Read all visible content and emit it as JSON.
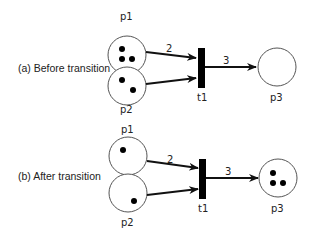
{
  "panels": [
    {
      "caption": "(a) Before transition",
      "places": {
        "p1": {
          "label": "p1",
          "tokens": 3
        },
        "p2": {
          "label": "p2",
          "tokens": 2
        },
        "p3": {
          "label": "p3",
          "tokens": 0
        }
      },
      "transition": {
        "label": "t1"
      },
      "arcs": {
        "p1_t1": "2",
        "t1_p3": "3"
      }
    },
    {
      "caption": "(b) After transition",
      "places": {
        "p1": {
          "label": "p1",
          "tokens": 1
        },
        "p2": {
          "label": "p2",
          "tokens": 1
        },
        "p3": {
          "label": "p3",
          "tokens": 3
        }
      },
      "transition": {
        "label": "t1"
      },
      "arcs": {
        "p1_t1": "2",
        "t1_p3": "3"
      }
    }
  ],
  "colors": {
    "stroke": "#555555",
    "token": "#000000",
    "transition": "#000000"
  }
}
